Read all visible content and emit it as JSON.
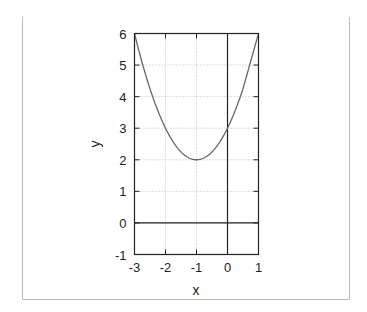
{
  "chart_data": {
    "type": "line",
    "title": "",
    "xlabel": "x",
    "ylabel": "y",
    "xlim": [
      -3,
      1
    ],
    "ylim": [
      -1,
      6
    ],
    "grid": true,
    "x_ticks": [
      -3,
      -2,
      -1,
      0,
      1
    ],
    "y_ticks": [
      -1,
      0,
      1,
      2,
      3,
      4,
      5,
      6
    ],
    "x_tick_labels": [
      "-3",
      "-2",
      "-1",
      "0",
      "1"
    ],
    "y_tick_labels": [
      "-1",
      "0",
      "1",
      "2",
      "3",
      "4",
      "5",
      "6"
    ],
    "series": [
      {
        "name": "y = (x+1)^2 + 2",
        "x": [
          -3,
          -2.5,
          -2,
          -1.5,
          -1,
          -0.5,
          0,
          0.5,
          1
        ],
        "values": [
          6,
          4.25,
          3,
          2.25,
          2,
          2.25,
          3,
          4.25,
          6
        ],
        "color": "#666666"
      }
    ],
    "axes_lines": {
      "x_axis_at_y": 0,
      "y_axis_at_x": 0
    }
  }
}
